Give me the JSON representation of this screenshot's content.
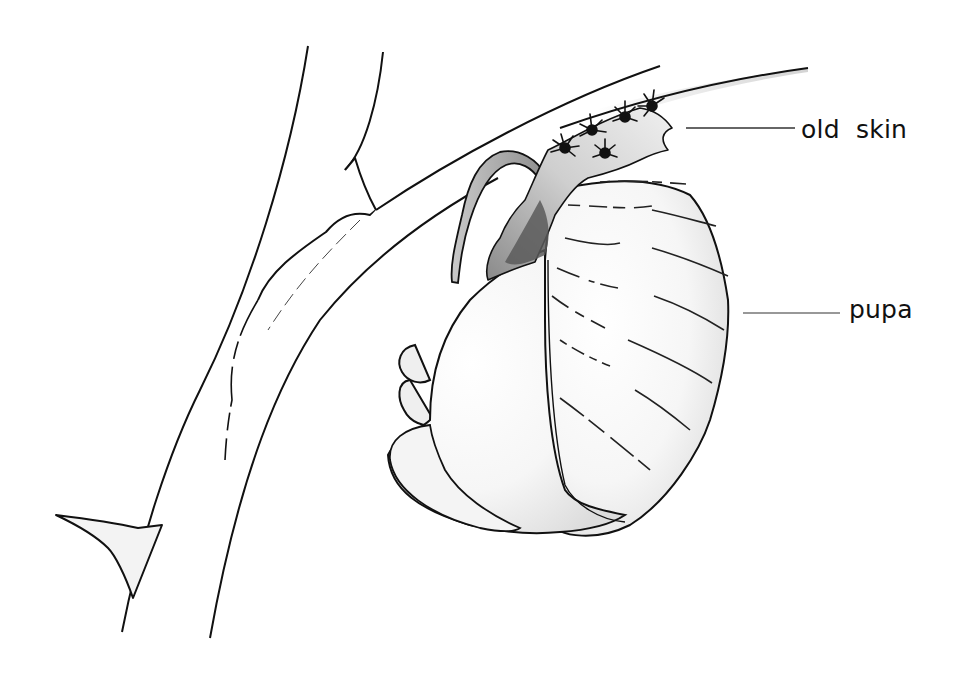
{
  "figure": {
    "colors": {
      "background": "#ffffff",
      "ink": "#111111",
      "shade_light": "#e6e6e6",
      "shade_mid": "#bdbdbd",
      "shade_dark": "#5a5a5a"
    },
    "labels": [
      {
        "id": "old-skin",
        "text": "old  skin",
        "leader_from": [
          686,
          128
        ],
        "leader_to": [
          795,
          128
        ]
      },
      {
        "id": "pupa",
        "text": "pupa",
        "leader_from": [
          743,
          313
        ],
        "leader_to": [
          840,
          313
        ]
      }
    ]
  }
}
